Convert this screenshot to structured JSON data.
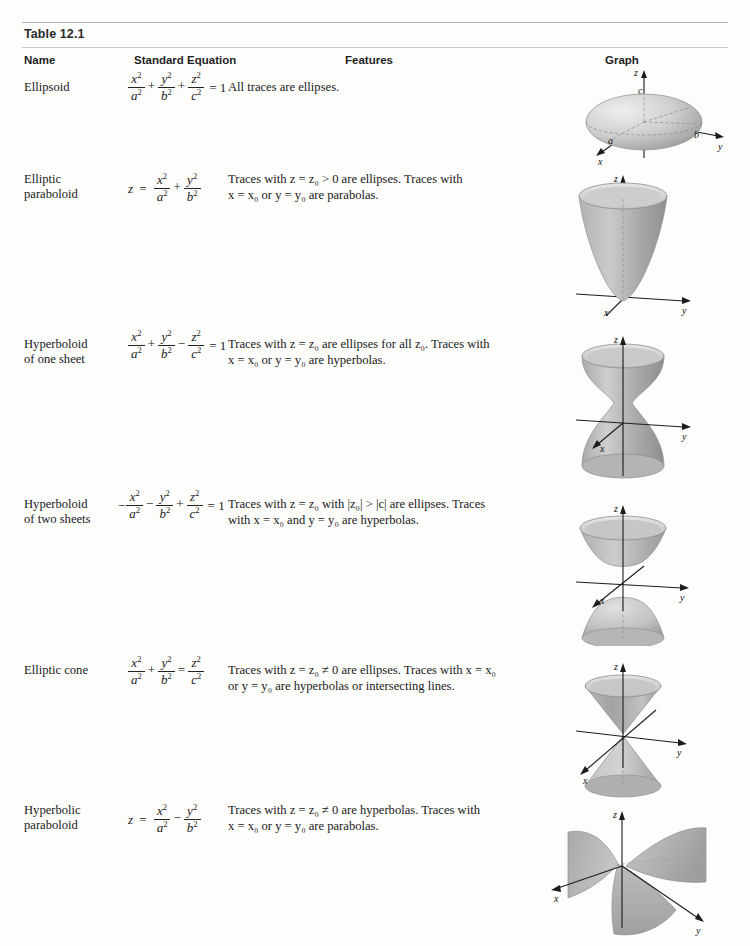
{
  "table": {
    "title": "Table 12.1",
    "headers": {
      "name": "Name",
      "equation": "Standard Equation",
      "features": "Features",
      "graph": "Graph"
    }
  },
  "rows": [
    {
      "id": "ellipsoid",
      "name_line1": "Ellipsoid",
      "name_line2": "",
      "equation_text": "x²/a² + y²/b² + z²/c² = 1",
      "features_line1": "All traces are ellipses.",
      "features_line2": "",
      "graph_labels": [
        "z",
        "c",
        "a",
        "b",
        "y",
        "x"
      ]
    },
    {
      "id": "elliptic-paraboloid",
      "name_line1": "Elliptic",
      "name_line2": "paraboloid",
      "equation_text": "z = x²/a² + y²/b²",
      "features_line1": "Traces with z = z₀ > 0 are ellipses. Traces with",
      "features_line2": "x = x₀ or y = y₀ are parabolas.",
      "graph_labels": [
        "z",
        "y",
        "x"
      ]
    },
    {
      "id": "hyperboloid-one-sheet",
      "name_line1": "Hyperboloid",
      "name_line2": "of one sheet",
      "equation_text": "x²/a² + y²/b² − z²/c² = 1",
      "features_line1": "Traces with z = z₀ are ellipses for all z₀. Traces with",
      "features_line2": "x = x₀ or y = y₀ are hyperbolas.",
      "graph_labels": [
        "z",
        "y",
        "x"
      ]
    },
    {
      "id": "hyperboloid-two-sheets",
      "name_line1": "Hyperboloid",
      "name_line2": "of two sheets",
      "equation_text": "−x²/a² − y²/b² + z²/c² = 1",
      "features_line1": "Traces with z = z₀ with |z₀| > |c| are ellipses. Traces",
      "features_line2": "with x = x₀ and y = y₀ are hyperbolas.",
      "graph_labels": [
        "z",
        "y",
        "x"
      ]
    },
    {
      "id": "elliptic-cone",
      "name_line1": "Elliptic cone",
      "name_line2": "",
      "equation_text": "x²/a² + y²/b² = z²/c²",
      "features_line1": "Traces with z = z₀ ≠ 0 are ellipses. Traces with x = x₀",
      "features_line2": "or y = y₀ are hyperbolas or intersecting lines.",
      "graph_labels": [
        "z",
        "y",
        "x"
      ]
    },
    {
      "id": "hyperbolic-paraboloid",
      "name_line1": "Hyperbolic",
      "name_line2": "paraboloid",
      "equation_text": "z = x²/a² − y²/b²",
      "features_line1": "Traces with z = z₀ ≠ 0 are hyperbolas. Traces with",
      "features_line2": "x = x₀ or y = y₀ are parabolas.",
      "graph_labels": [
        "z",
        "y",
        "x"
      ]
    }
  ],
  "colors": {
    "rule": "#b9b9b9",
    "text": "#1a1a1a",
    "surface_light": "#d8d8d8",
    "surface_mid": "#b5b5b5",
    "surface_dark": "#9a9a9a",
    "axis": "#1c1c1c"
  }
}
